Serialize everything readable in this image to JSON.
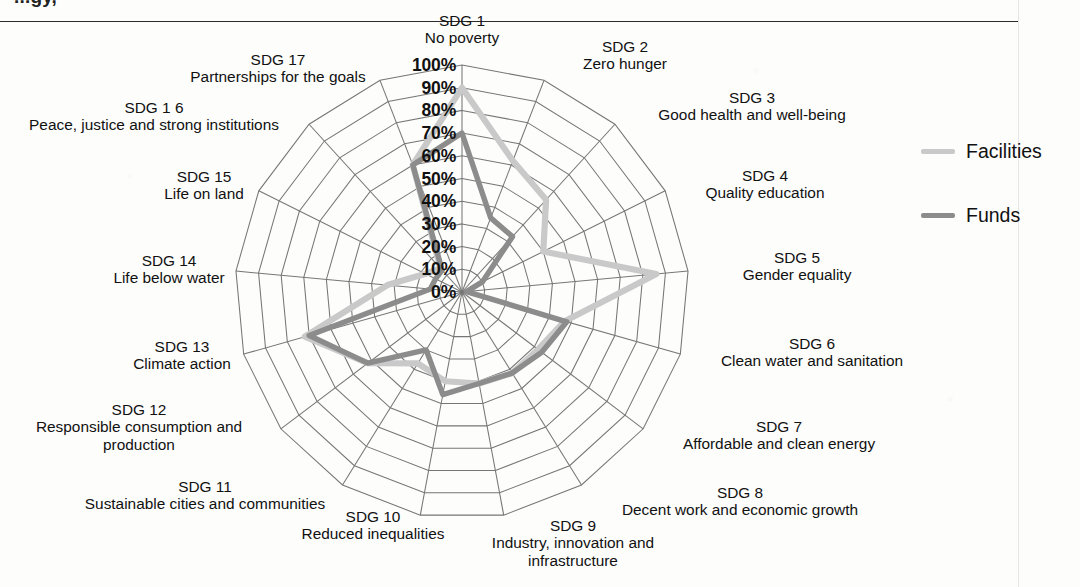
{
  "page": {
    "cropped_heading": "...gy,",
    "background": "#fdfdfc"
  },
  "legend": {
    "position": "right",
    "items": [
      {
        "label": "Facilities",
        "color": "#c9c9c9"
      },
      {
        "label": "Funds",
        "color": "#8c8c8c"
      }
    ]
  },
  "chart_data": {
    "type": "line",
    "subtype": "radar",
    "title": "",
    "xlabel": "",
    "ylabel": "",
    "ylim": [
      0,
      100
    ],
    "grid": true,
    "legend_position": "right",
    "tick_labels": [
      "0%",
      "10%",
      "20%",
      "30%",
      "40%",
      "50%",
      "60%",
      "70%",
      "80%",
      "90%",
      "100%"
    ],
    "tick_values": [
      0,
      10,
      20,
      30,
      40,
      50,
      60,
      70,
      80,
      90,
      100
    ],
    "categories": [
      "SDG 1\nNo poverty",
      "SDG 2\nZero hunger",
      "SDG 3\nGood health and well-being",
      "SDG 4\nQuality education",
      "SDG 5\nGender equality",
      "SDG 6\nClean water and sanitation",
      "SDG 7\nAffordable and clean energy",
      "SDG 8\nDecent work and economic growth",
      "SDG 9\nIndustry, innovation and\ninfrastructure",
      "SDG 10\nReduced inequalities",
      "SDG 11\nSustainable cities and communities",
      "SDG 12\nResponsible consumption and\nproduction",
      "SDG 13\nClimate action",
      "SDG 14\nLife below water",
      "SDG 15\nLife on land",
      "SDG 1 6\nPeace, justice and strong institutions",
      "SDG 17\nPartnerships for the goals"
    ],
    "category_numbers": [
      "SDG 1",
      "SDG 2",
      "SDG 3",
      "SDG 4",
      "SDG 5",
      "SDG 6",
      "SDG 7",
      "SDG 8",
      "SDG 9",
      "SDG 10",
      "SDG 11",
      "SDG 12",
      "SDG 13",
      "SDG 14",
      "SDG 15",
      "SDG 1 6",
      "SDG 17"
    ],
    "category_names": [
      "No poverty",
      "Zero hunger",
      "Good health and well-being",
      "Quality education",
      "Gender equality",
      "Clean water and sanitation",
      "Affordable and clean energy",
      "Decent work and economic growth",
      "Industry, innovation and\ninfrastructure",
      "Reduced inequalities",
      "Sustainable cities and communities",
      "Responsible consumption and\nproduction",
      "Climate action",
      "Life below water",
      "Life on land",
      "Peace, justice and strong institutions",
      "Partnerships for the goals"
    ],
    "series": [
      {
        "name": "Facilities",
        "color": "#c9c9c9",
        "values": [
          90,
          62,
          55,
          40,
          86,
          47,
          42,
          42,
          41,
          40,
          37,
          52,
          72,
          33,
          18,
          14,
          60
        ]
      },
      {
        "name": "Funds",
        "color": "#8c8c8c",
        "values": [
          70,
          35,
          33,
          10,
          2,
          48,
          44,
          42,
          41,
          46,
          30,
          52,
          70,
          14,
          13,
          13,
          60
        ]
      }
    ]
  },
  "geometry": {
    "center_x": 462,
    "center_y": 292,
    "radius_100": 227,
    "axis_count": 17,
    "start_angle_deg": -90
  }
}
